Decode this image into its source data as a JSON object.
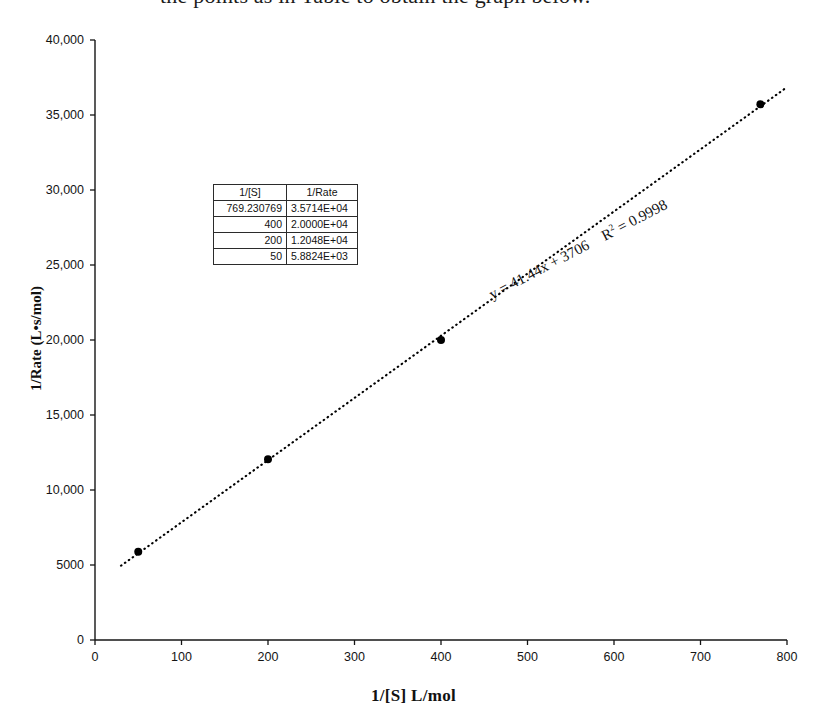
{
  "page": {
    "top_sentence": "the points as in Table to obtain the graph below."
  },
  "chart_data": {
    "type": "scatter",
    "title": "",
    "xlabel": "1/[S]   L/mol",
    "ylabel": "1/Rate (L•s/mol)",
    "xlim": [
      0,
      800
    ],
    "ylim": [
      0,
      40000
    ],
    "xticks": [
      "0",
      "100",
      "200",
      "300",
      "400",
      "500",
      "600",
      "700",
      "800"
    ],
    "xtick_values": [
      0,
      100,
      200,
      300,
      400,
      500,
      600,
      700,
      800
    ],
    "yticks": [
      "0",
      "5000",
      "10,000",
      "15,000",
      "20,000",
      "25,000",
      "30,000",
      "35,000",
      "40,000"
    ],
    "ytick_values": [
      0,
      5000,
      10000,
      15000,
      20000,
      25000,
      30000,
      35000,
      40000
    ],
    "grid": false,
    "legend": "none",
    "marker_color": "#000000",
    "marker_size": 8,
    "trendline": {
      "style": "dotted",
      "color": "#000000",
      "slope": 41.44,
      "intercept": 3706,
      "equation": "y = 41.44x + 3706",
      "r_squared_label": "R",
      "r_squared_exponent": "2",
      "r_squared_value": "= 0.9998"
    },
    "x": [
      50,
      200,
      400,
      769.230769
    ],
    "y": [
      5882.4,
      12048,
      20000,
      35714
    ],
    "points": [
      {
        "x": 50,
        "y": 5882.4
      },
      {
        "x": 200,
        "y": 12048
      },
      {
        "x": 400,
        "y": 20000
      },
      {
        "x": 769.230769,
        "y": 35714
      }
    ]
  },
  "data_table": {
    "headers": [
      "1/[S]",
      "1/Rate"
    ],
    "rows": [
      {
        "x": "769.230769",
        "y": "3.5714E+04"
      },
      {
        "x": "400",
        "y": "2.0000E+04"
      },
      {
        "x": "200",
        "y": "1.2048E+04"
      },
      {
        "x": "50",
        "y": "5.8824E+03"
      }
    ]
  }
}
